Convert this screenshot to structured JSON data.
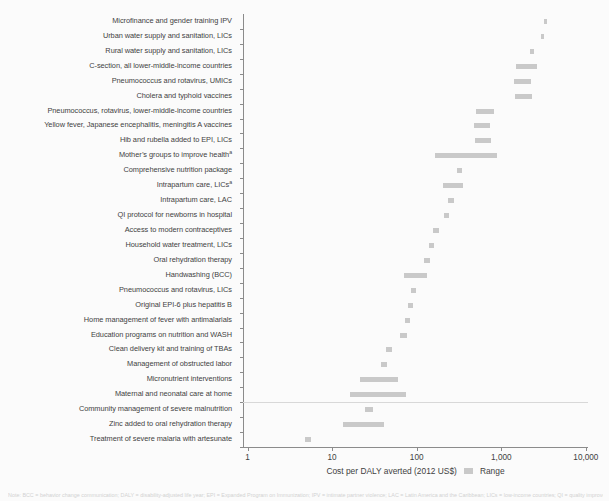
{
  "chart_data": {
    "type": "bar",
    "subtype": "horizontal-range",
    "title": "",
    "xlabel": "Cost per DALY averted (2012 US$)",
    "ylabel": "",
    "xscale": "log",
    "xlim": [
      1,
      10000
    ],
    "xticks": [
      1,
      10,
      100,
      1000,
      10000
    ],
    "xticklabels": [
      "1",
      "10",
      "100",
      "1,000",
      "10,000"
    ],
    "grid": false,
    "legend": {
      "position": "bottom",
      "entries": [
        {
          "label": "Range",
          "color": "#c9c9c9"
        }
      ]
    },
    "separator_after_category": "Maternal and neonatal care at home",
    "categories": [
      "Microfinance and gender training IPV",
      "Urban water supply and sanitation, LICs",
      "Rural water supply and sanitation, LICs",
      "C-section, all lower-middle-income countries",
      "Pneumococcus and rotavirus, UMICs",
      "Cholera and typhoid vaccines",
      "Pneumococcus, rotavirus, lower-middle-income countries",
      "Yellow fever, Japanese encephalitis, meningitis A vaccines",
      "Hib and rubella added to EPI, LICs",
      "Mother’s groups to improve healthᵃ",
      "Comprehensive nutrition package",
      "Intrapartum care, LICsᵃ",
      "Intrapartum care, LAC",
      "QI protocol for newborns in hospital",
      "Access to modern contraceptives",
      "Household water treatment, LICs",
      "Oral rehydration therapy",
      "Handwashing (BCC)",
      "Pneumococcus and rotavirus, LICs",
      "Original EPI-6 plus hepatitis B",
      "Home management of fever with antimalarials",
      "Education programs on nutrition and WASH",
      "Clean delivery kit and training of TBAs",
      "Management of obstructed labor",
      "Micronutrient interventions",
      "Maternal and neonatal care at home",
      "Community management of severe malnutrition",
      "Zinc added to oral rehydration therapy",
      "Treatment of severe malaria with artesunate"
    ],
    "ranges": [
      {
        "category": "Microfinance and gender training IPV",
        "low": 3100,
        "high": 3400
      },
      {
        "category": "Urban water supply and sanitation, LICs",
        "low": 2850,
        "high": 3150
      },
      {
        "category": "Rural water supply and sanitation, LICs",
        "low": 2100,
        "high": 2350
      },
      {
        "category": "C-section, all lower-middle-income countries",
        "low": 1450,
        "high": 2600
      },
      {
        "category": "Pneumococcus and rotavirus, UMICs",
        "low": 1380,
        "high": 2200
      },
      {
        "category": "Cholera and typhoid vaccines",
        "low": 1400,
        "high": 2250
      },
      {
        "category": "Pneumococcus, rotavirus, lower-middle-income countries",
        "low": 490,
        "high": 790
      },
      {
        "category": "Yellow fever, Japanese encephalitis, meningitis A vaccines",
        "low": 460,
        "high": 720
      },
      {
        "category": "Hib and rubella added to EPI, LICs",
        "low": 470,
        "high": 730
      },
      {
        "category": "Mother’s groups to improve healthᵃ",
        "low": 160,
        "high": 860
      },
      {
        "category": "Comprehensive nutrition package",
        "low": 290,
        "high": 330
      },
      {
        "category": "Intrapartum care, LICsᵃ",
        "low": 200,
        "high": 340
      },
      {
        "category": "Intrapartum care, LAC",
        "low": 230,
        "high": 265
      },
      {
        "category": "QI protocol for newborns in hospital",
        "low": 205,
        "high": 235
      },
      {
        "category": "Access to modern contraceptives",
        "low": 150,
        "high": 180
      },
      {
        "category": "Household water treatment, LICs",
        "low": 135,
        "high": 155
      },
      {
        "category": "Oral rehydration therapy",
        "low": 120,
        "high": 140
      },
      {
        "category": "Handwashing (BCC)",
        "low": 68,
        "high": 128
      },
      {
        "category": "Pneumococcus and rotavirus, LICs",
        "low": 83,
        "high": 96
      },
      {
        "category": "Original EPI-6 plus hepatitis B",
        "low": 76,
        "high": 88
      },
      {
        "category": "Home management of fever with antimalarials",
        "low": 70,
        "high": 82
      },
      {
        "category": "Education programs on nutrition and WASH",
        "low": 62,
        "high": 74
      },
      {
        "category": "Clean delivery kit and training of TBAs",
        "low": 42,
        "high": 50
      },
      {
        "category": "Management of obstructed labor",
        "low": 37,
        "high": 43
      },
      {
        "category": "Micronutrient interventions",
        "low": 21,
        "high": 58
      },
      {
        "category": "Maternal and neonatal care at home",
        "low": 16,
        "high": 72
      },
      {
        "category": "Community management of severe malnutrition",
        "low": 24,
        "high": 30
      },
      {
        "category": "Zinc added to oral rehydration therapy",
        "low": 13,
        "high": 40
      },
      {
        "category": "Treatment of severe malaria with artesunate",
        "low": 4.6,
        "high": 5.5
      }
    ]
  },
  "legend_label": "Range",
  "axis_title": "Cost per DALY averted (2012 US$)",
  "footnote": "Note: BCC = behavior change communication; DALY = disability-adjusted life year; EPI = Expanded Program on Immunization; IPV = intimate partner violence; LAC = Latin America and the Caribbean; LICs = low-income countries; QI = quality improvement; TBAs = traditional birth attendants; UMICs = upper-middle-income countries; WASH = water, sanitation, and hygiene."
}
